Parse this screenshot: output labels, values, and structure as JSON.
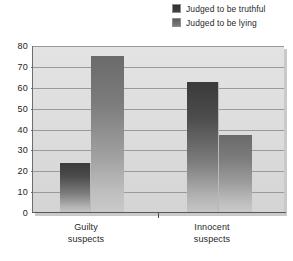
{
  "legend": {
    "position": "top-right",
    "entries": [
      {
        "label": "Judged to be truthful",
        "swatch": "dark-gray-square-icon",
        "color": "#3a3a3a"
      },
      {
        "label": "Judged to be lying",
        "swatch": "light-gray-square-icon",
        "color": "#6a6a6a"
      }
    ]
  },
  "axes": {
    "y_ticks": [
      "80",
      "70",
      "60",
      "50",
      "40",
      "30",
      "20",
      "10",
      "0"
    ],
    "x_categories": [
      {
        "line1": "Guilty",
        "line2": "suspects"
      },
      {
        "line1": "Innocent",
        "line2": "suspects"
      }
    ]
  },
  "chart_data": {
    "type": "bar",
    "title": "",
    "subtitle": "",
    "xlabel": "",
    "ylabel": "",
    "ylim": [
      0,
      80
    ],
    "ytick_step": 10,
    "grid": true,
    "legend_position": "top-right",
    "categories": [
      "Guilty suspects",
      "Innocent suspects"
    ],
    "series": [
      {
        "name": "Judged to be truthful",
        "values": [
          24,
          63
        ],
        "color": "#3a3a3a"
      },
      {
        "name": "Judged to be lying",
        "values": [
          75,
          37.5
        ],
        "color": "#6a6a6a"
      }
    ]
  },
  "style": {
    "panel_background": "#dcdcdc",
    "gridline_color": "#9a9a9a",
    "axis_color": "#585858",
    "page_background": "#ffffff"
  }
}
